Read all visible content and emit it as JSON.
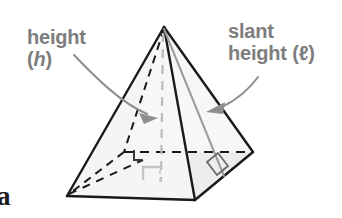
{
  "figure": {
    "kind": "square-pyramid-geometry-diagram",
    "background_color": "#ffffff",
    "labels": {
      "height": {
        "line1": "height",
        "line2_open": "(",
        "line2_var": "h",
        "line2_close": ")",
        "color": "#7d7d7d"
      },
      "slant_height": {
        "line1": "slant",
        "line2_word": "height",
        "line2_paren": " (ℓ)",
        "color": "#7d7d7d"
      }
    },
    "page_letter": "a",
    "colors": {
      "edge_solid": "#1a1a1a",
      "edge_hidden_dashed": "#1a1a1a",
      "face_fill_left": "#f4f4f4",
      "face_fill_front": "#f0f0f0",
      "face_fill_right": "#ebebeb",
      "height_line": "#b5b5b5",
      "slant_line": "#9a9a9a",
      "arrow": "#8e8e8e",
      "right_angle_center": "#c2c2c2",
      "right_angle_face": "#5a5a5a",
      "text": "#7d7d7d",
      "page_letter": "#1c1c1c"
    },
    "geometry": {
      "apex": [
        164,
        27
      ],
      "base_left": [
        67,
        196
      ],
      "base_front": [
        195,
        200
      ],
      "base_right": [
        253,
        152
      ],
      "base_back_hidden": [
        124,
        152
      ],
      "base_center": [
        160,
        174
      ],
      "slant_foot": [
        224,
        176
      ]
    },
    "annotations": {
      "right_angle_at_center": "height meets base at 90 degrees",
      "right_angle_at_slant_foot": "slant height meets base edge at 90 degrees",
      "arrow_left": "points from height label to vertical height segment",
      "arrow_right": "points from slant height label to slant height segment"
    }
  }
}
